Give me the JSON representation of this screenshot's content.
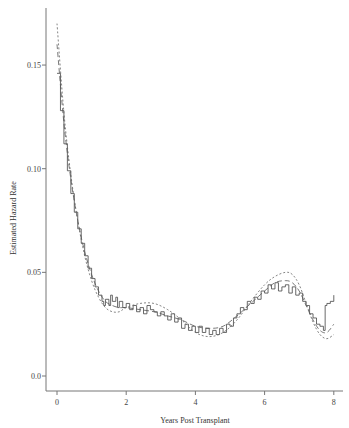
{
  "chart_data": {
    "type": "line",
    "title": "",
    "xlabel": "Years Post Transplant",
    "ylabel": "Estimated Hazard Rate",
    "xlim": [
      -0.3,
      8.3
    ],
    "ylim": [
      0.0,
      0.175
    ],
    "x_ticks": [
      0,
      2,
      4,
      6,
      8
    ],
    "x_tick_labels": [
      "0",
      "2",
      "4",
      "6",
      "8"
    ],
    "y_ticks": [
      0.0,
      0.05,
      0.1,
      0.15
    ],
    "y_tick_labels": [
      "0.0",
      "0.05",
      "0.10",
      "0.15"
    ],
    "grid": false,
    "legend": null,
    "series": [
      {
        "name": "Step estimate (solid)",
        "style": "solid",
        "color": "#444444",
        "x": [
          0.0,
          0.1,
          0.2,
          0.3,
          0.4,
          0.5,
          0.6,
          0.7,
          0.8,
          0.9,
          1.0,
          1.1,
          1.2,
          1.3,
          1.35,
          1.4,
          1.5,
          1.55,
          1.6,
          1.7,
          1.75,
          1.8,
          1.9,
          2.0,
          2.1,
          2.2,
          2.3,
          2.4,
          2.5,
          2.6,
          2.7,
          2.8,
          2.9,
          3.0,
          3.1,
          3.2,
          3.3,
          3.4,
          3.5,
          3.6,
          3.7,
          3.8,
          3.9,
          4.0,
          4.1,
          4.2,
          4.3,
          4.4,
          4.5,
          4.6,
          4.7,
          4.8,
          4.9,
          5.0,
          5.1,
          5.2,
          5.3,
          5.4,
          5.5,
          5.6,
          5.7,
          5.8,
          5.9,
          6.0,
          6.1,
          6.2,
          6.3,
          6.4,
          6.5,
          6.6,
          6.7,
          6.8,
          6.9,
          7.0,
          7.1,
          7.2,
          7.3,
          7.4,
          7.5,
          7.6,
          7.7,
          7.75,
          7.8,
          7.9,
          8.0
        ],
        "y": [
          0.146,
          0.128,
          0.112,
          0.099,
          0.088,
          0.079,
          0.071,
          0.064,
          0.058,
          0.052,
          0.047,
          0.043,
          0.039,
          0.036,
          0.034,
          0.037,
          0.034,
          0.039,
          0.036,
          0.038,
          0.033,
          0.036,
          0.033,
          0.035,
          0.032,
          0.034,
          0.031,
          0.033,
          0.03,
          0.034,
          0.032,
          0.031,
          0.029,
          0.031,
          0.029,
          0.027,
          0.03,
          0.026,
          0.028,
          0.023,
          0.025,
          0.022,
          0.024,
          0.021,
          0.024,
          0.021,
          0.023,
          0.02,
          0.022,
          0.02,
          0.023,
          0.021,
          0.025,
          0.024,
          0.028,
          0.03,
          0.033,
          0.032,
          0.036,
          0.035,
          0.038,
          0.037,
          0.041,
          0.04,
          0.044,
          0.042,
          0.045,
          0.041,
          0.043,
          0.044,
          0.04,
          0.043,
          0.039,
          0.04,
          0.036,
          0.034,
          0.03,
          0.028,
          0.025,
          0.024,
          0.022,
          0.034,
          0.035,
          0.036,
          0.039
        ]
      },
      {
        "name": "Smooth estimate A (long dash)",
        "style": "dashed",
        "color": "#555555",
        "x": [
          0.0,
          0.2,
          0.4,
          0.6,
          0.8,
          1.0,
          1.2,
          1.4,
          1.6,
          1.8,
          2.0,
          2.4,
          2.8,
          3.2,
          3.6,
          4.0,
          4.4,
          4.8,
          5.2,
          5.6,
          6.0,
          6.3,
          6.6,
          6.8,
          7.0,
          7.2,
          7.4,
          7.6,
          7.8,
          8.0
        ],
        "y": [
          0.16,
          0.122,
          0.095,
          0.075,
          0.06,
          0.049,
          0.041,
          0.036,
          0.034,
          0.033,
          0.033,
          0.032,
          0.031,
          0.029,
          0.027,
          0.024,
          0.023,
          0.024,
          0.029,
          0.035,
          0.041,
          0.045,
          0.046,
          0.045,
          0.041,
          0.034,
          0.027,
          0.022,
          0.021,
          0.025
        ]
      },
      {
        "name": "Smooth estimate B (short dash)",
        "style": "dotted",
        "color": "#666666",
        "x": [
          0.0,
          0.2,
          0.4,
          0.6,
          0.8,
          1.0,
          1.2,
          1.4,
          1.6,
          1.8,
          2.0,
          2.4,
          2.8,
          3.2,
          3.6,
          4.0,
          4.4,
          4.8,
          5.2,
          5.6,
          6.0,
          6.3,
          6.6,
          6.8,
          7.0,
          7.2,
          7.4,
          7.6,
          7.8,
          8.0
        ],
        "y": [
          0.17,
          0.127,
          0.097,
          0.075,
          0.058,
          0.046,
          0.038,
          0.033,
          0.031,
          0.031,
          0.033,
          0.035,
          0.035,
          0.032,
          0.027,
          0.021,
          0.019,
          0.021,
          0.027,
          0.036,
          0.044,
          0.048,
          0.05,
          0.049,
          0.044,
          0.035,
          0.026,
          0.02,
          0.018,
          0.02
        ]
      }
    ]
  }
}
